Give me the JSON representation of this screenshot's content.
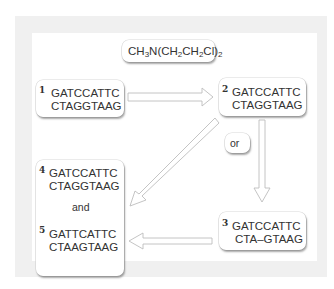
{
  "reagent": {
    "formula_parts": [
      "CH",
      "3",
      "N(CH",
      "2",
      "CH",
      "2",
      "Cl)",
      "2"
    ],
    "text": "CH3N(CH2CH2Cl)2"
  },
  "connector_label": "or",
  "and_label": "and",
  "sequences": [
    {
      "id": "1",
      "top": "GATCCATTC",
      "bottom": "CTAGGTAAG"
    },
    {
      "id": "2",
      "top": "GATCCATTC",
      "bottom": "CTAGGTAAG"
    },
    {
      "id": "3",
      "top": "GATCCATTC",
      "bottom": "CTA–GTAAG"
    },
    {
      "id": "4",
      "top": "GATCCATTC",
      "bottom": "CTAGGTAAG"
    },
    {
      "id": "5",
      "top": "GATTCATTC",
      "bottom": "CTAAGTAAG"
    }
  ],
  "arrows": [
    {
      "from": "1",
      "to": "2"
    },
    {
      "from": "2",
      "to": "3"
    },
    {
      "from": "2",
      "to": "4"
    },
    {
      "from": "3",
      "to": "5"
    }
  ],
  "colors": {
    "panel_bg": "#f0f0f0",
    "box_bg": "#ffffff",
    "arrow_stroke": "#c8c8c8",
    "text": "#333333"
  }
}
